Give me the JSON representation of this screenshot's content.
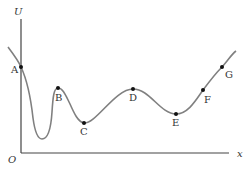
{
  "diagram": {
    "axes": {
      "y_label": "U",
      "x_label": "x",
      "origin_label": "O"
    },
    "points": [
      {
        "label": "A",
        "x": 21,
        "y": 67
      },
      {
        "label": "B",
        "x": 58,
        "y": 88
      },
      {
        "label": "C",
        "x": 84,
        "y": 123
      },
      {
        "label": "D",
        "x": 133,
        "y": 89
      },
      {
        "label": "E",
        "x": 176,
        "y": 114
      },
      {
        "label": "F",
        "x": 203,
        "y": 90
      },
      {
        "label": "G",
        "x": 222,
        "y": 67
      }
    ],
    "colors": {
      "axis": "#444444",
      "curve": "#808080",
      "point": "#111111",
      "text": "#333333"
    }
  }
}
